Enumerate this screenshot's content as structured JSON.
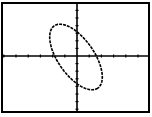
{
  "chart_data": {
    "type": "line",
    "title": "",
    "xlabel": "",
    "ylabel": "",
    "xlim": [
      -6,
      6
    ],
    "ylim": [
      -7,
      7
    ],
    "grid": false,
    "axes_ticks": {
      "x_tick_spacing": 1,
      "y_tick_spacing": 1
    },
    "series": [
      {
        "name": "ellipse",
        "style": "dashed",
        "color": "#000000",
        "center": [
          0,
          0
        ],
        "x_intercepts": [
          -2,
          2
        ],
        "y_intercepts": [
          3,
          -3
        ],
        "approx_extent": {
          "xmin": -2.5,
          "xmax": 2.5,
          "ymin": -4,
          "ymax": 4
        }
      }
    ]
  },
  "colors": {
    "background": "#ffffff",
    "ink": "#000000"
  }
}
